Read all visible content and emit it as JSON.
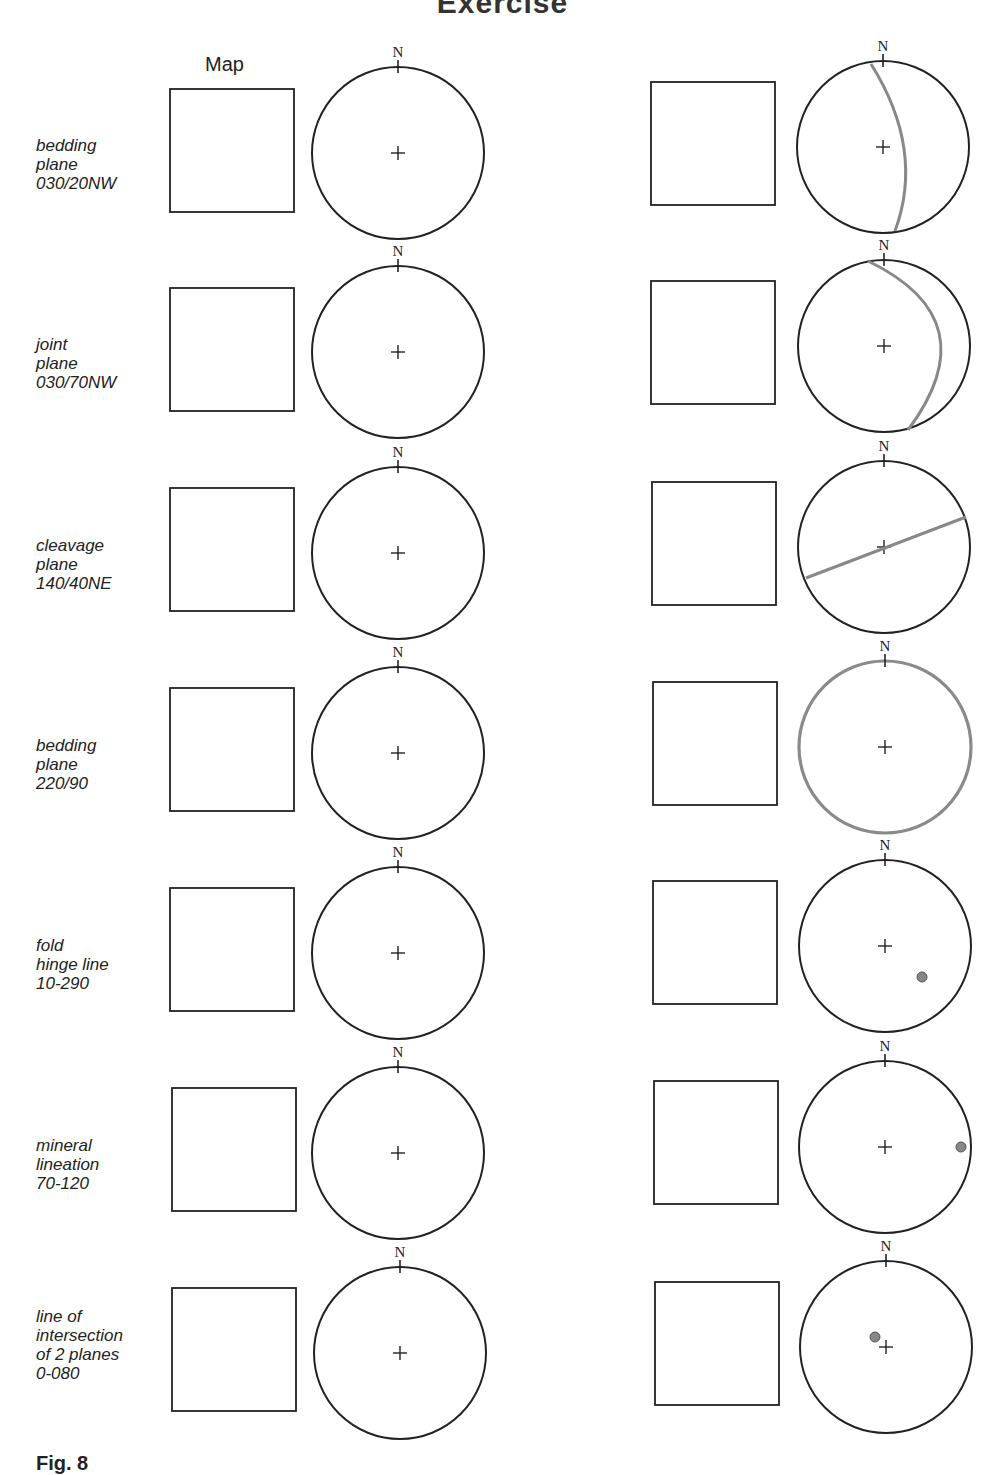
{
  "page": {
    "title": "Exercise",
    "map_header": "Map",
    "figure_label": "Fig. 8",
    "north_label": "N"
  },
  "colors": {
    "ink": "#222222",
    "plot_gray": "#888888"
  },
  "rows": [
    {
      "label": "bedding\nplane\n030/20NW",
      "feature": "plane",
      "strike": 30,
      "dip": 20,
      "dip_dir": "NW",
      "answer": "great circle arc, shallow dip to NW"
    },
    {
      "label": "joint\nplane\n030/70NW",
      "feature": "plane",
      "strike": 30,
      "dip": 70,
      "dip_dir": "NW",
      "answer": "great circle arc near primitive, steep dip"
    },
    {
      "label": "cleavage\nplane\n140/40NE",
      "feature": "plane",
      "strike": 140,
      "dip": 40,
      "dip_dir": "NE",
      "answer": "straight line through centre"
    },
    {
      "label": "bedding\nplane\n220/90",
      "feature": "plane",
      "strike": 220,
      "dip": 90,
      "answer": "primitive circle"
    },
    {
      "label": "fold\nhinge line\n10-290",
      "feature": "line",
      "plunge": 10,
      "trend": 290,
      "answer": "point"
    },
    {
      "label": "mineral\nlineation\n70-120",
      "feature": "line",
      "plunge": 70,
      "trend": 120,
      "answer": "point near primitive"
    },
    {
      "label": "line of\nintersection\nof 2 planes\n0-080",
      "feature": "line",
      "plunge": 0,
      "trend": 80,
      "answer": "point near centre"
    }
  ]
}
